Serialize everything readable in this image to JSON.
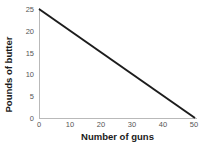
{
  "chart_data": {
    "type": "line",
    "title": "",
    "subtitle": "",
    "xlabel": "Number of guns",
    "ylabel": "Pounds of butter",
    "xlim": [
      0,
      50
    ],
    "ylim": [
      0,
      25
    ],
    "xticks": [
      0,
      10,
      20,
      30,
      40,
      50
    ],
    "yticks": [
      0,
      5,
      10,
      15,
      20,
      25
    ],
    "xtick_labels": [
      "0",
      "10",
      "20",
      "30",
      "40",
      "50"
    ],
    "ytick_labels": [
      "0",
      "5",
      "10",
      "15",
      "20",
      "25"
    ],
    "grid": false,
    "legend": null,
    "series": [
      {
        "name": "production possibilities frontier",
        "color": "#1c1c1c",
        "line_width": 2,
        "x": [
          0,
          50
        ],
        "y": [
          25,
          0
        ]
      }
    ],
    "annotations": []
  },
  "axes": {
    "axis_color": "#b9b9b9",
    "tick_label_color": "#555555",
    "axis_label_color": "#1a1a1a"
  },
  "background": {
    "color": "#ffffff"
  }
}
